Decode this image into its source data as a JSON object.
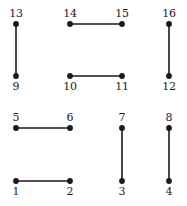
{
  "figure": {
    "type": "graph-diagram",
    "width": 187,
    "height": 206,
    "background_color": "#ffffff",
    "ink_color": "#1a1a1a",
    "vertex_radius": 2.9,
    "edge_width": 1.6,
    "columns_x": [
      16,
      70,
      122,
      169
    ],
    "rows_y": [
      24,
      76,
      128,
      181
    ],
    "vertices": [
      {
        "id": 1,
        "label": "1",
        "x": 16,
        "y": 181,
        "label_x": 16,
        "label_y": 186,
        "label_position": "below"
      },
      {
        "id": 2,
        "label": "2",
        "x": 70,
        "y": 181,
        "label_x": 70,
        "label_y": 186,
        "label_position": "below"
      },
      {
        "id": 3,
        "label": "3",
        "x": 122,
        "y": 181,
        "label_x": 122,
        "label_y": 186,
        "label_position": "below"
      },
      {
        "id": 4,
        "label": "4",
        "x": 169,
        "y": 181,
        "label_x": 169,
        "label_y": 186,
        "label_position": "below"
      },
      {
        "id": 5,
        "label": "5",
        "x": 16,
        "y": 128,
        "label_x": 16,
        "label_y": 112,
        "label_position": "above"
      },
      {
        "id": 6,
        "label": "6",
        "x": 70,
        "y": 128,
        "label_x": 70,
        "label_y": 112,
        "label_position": "above"
      },
      {
        "id": 7,
        "label": "7",
        "x": 122,
        "y": 128,
        "label_x": 122,
        "label_y": 112,
        "label_position": "above"
      },
      {
        "id": 8,
        "label": "8",
        "x": 169,
        "y": 128,
        "label_x": 169,
        "label_y": 112,
        "label_position": "above"
      },
      {
        "id": 9,
        "label": "9",
        "x": 16,
        "y": 76,
        "label_x": 16,
        "label_y": 81,
        "label_position": "below"
      },
      {
        "id": 10,
        "label": "10",
        "x": 70,
        "y": 76,
        "label_x": 70,
        "label_y": 81,
        "label_position": "below"
      },
      {
        "id": 11,
        "label": "11",
        "x": 122,
        "y": 76,
        "label_x": 122,
        "label_y": 81,
        "label_position": "below"
      },
      {
        "id": 12,
        "label": "12",
        "x": 169,
        "y": 76,
        "label_x": 169,
        "label_y": 81,
        "label_position": "below"
      },
      {
        "id": 13,
        "label": "13",
        "x": 16,
        "y": 24,
        "label_x": 16,
        "label_y": 8,
        "label_position": "above"
      },
      {
        "id": 14,
        "label": "14",
        "x": 70,
        "y": 24,
        "label_x": 70,
        "label_y": 8,
        "label_position": "above"
      },
      {
        "id": 15,
        "label": "15",
        "x": 122,
        "y": 24,
        "label_x": 122,
        "label_y": 8,
        "label_position": "above"
      },
      {
        "id": 16,
        "label": "16",
        "x": 169,
        "y": 24,
        "label_x": 169,
        "label_y": 8,
        "label_position": "above"
      }
    ],
    "edges": [
      {
        "from": 13,
        "to": 9,
        "x1": 16,
        "y1": 24,
        "x2": 16,
        "y2": 76,
        "orientation": "vertical"
      },
      {
        "from": 14,
        "to": 15,
        "x1": 70,
        "y1": 24,
        "x2": 122,
        "y2": 24,
        "orientation": "horizontal"
      },
      {
        "from": 16,
        "to": 12,
        "x1": 169,
        "y1": 24,
        "x2": 169,
        "y2": 76,
        "orientation": "vertical"
      },
      {
        "from": 10,
        "to": 11,
        "x1": 70,
        "y1": 76,
        "x2": 122,
        "y2": 76,
        "orientation": "horizontal"
      },
      {
        "from": 5,
        "to": 6,
        "x1": 16,
        "y1": 128,
        "x2": 70,
        "y2": 128,
        "orientation": "horizontal"
      },
      {
        "from": 7,
        "to": 3,
        "x1": 122,
        "y1": 128,
        "x2": 122,
        "y2": 181,
        "orientation": "vertical"
      },
      {
        "from": 8,
        "to": 4,
        "x1": 169,
        "y1": 128,
        "x2": 169,
        "y2": 181,
        "orientation": "vertical"
      },
      {
        "from": 1,
        "to": 2,
        "x1": 16,
        "y1": 181,
        "x2": 70,
        "y2": 181,
        "orientation": "horizontal"
      }
    ]
  }
}
